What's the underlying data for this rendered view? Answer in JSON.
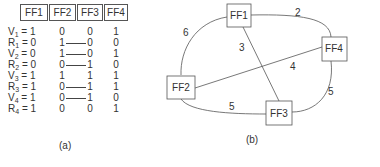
{
  "part_a": {
    "headers": [
      "FF1",
      "FF2",
      "FF3",
      "FF4"
    ],
    "rows": [
      {
        "var": "V",
        "sub": "1",
        "eq": "= 1",
        "vals": [
          "0",
          "0",
          "1"
        ],
        "link": false
      },
      {
        "var": "R",
        "sub": "1",
        "eq": "= 0",
        "vals": [
          "1",
          "0",
          "0"
        ],
        "link": true
      },
      {
        "var": "V",
        "sub": "2",
        "eq": "= 0",
        "vals": [
          "1",
          "0",
          "1"
        ],
        "link": true
      },
      {
        "var": "R",
        "sub": "2",
        "eq": "= 0",
        "vals": [
          "0",
          "1",
          "0"
        ],
        "link": true
      },
      {
        "var": "V",
        "sub": "3",
        "eq": "= 1",
        "vals": [
          "1",
          "1",
          "1"
        ],
        "link": false
      },
      {
        "var": "R",
        "sub": "3",
        "eq": "= 1",
        "vals": [
          "0",
          "1",
          "1"
        ],
        "link": true
      },
      {
        "var": "V",
        "sub": "4",
        "eq": "= 1",
        "vals": [
          "0",
          "1",
          "0"
        ],
        "link": true
      },
      {
        "var": "R",
        "sub": "4",
        "eq": "= 1",
        "vals": [
          "0",
          "0",
          "1"
        ],
        "link": false
      }
    ],
    "caption": "(a)"
  },
  "part_b": {
    "nodes": [
      {
        "id": "FF1",
        "label": "FF1"
      },
      {
        "id": "FF2",
        "label": "FF2"
      },
      {
        "id": "FF3",
        "label": "FF3"
      },
      {
        "id": "FF4",
        "label": "FF4"
      }
    ],
    "edges": [
      {
        "from": "FF1",
        "to": "FF4",
        "weight": "2"
      },
      {
        "from": "FF1",
        "to": "FF2",
        "weight": "6"
      },
      {
        "from": "FF1",
        "to": "FF3",
        "weight": "3"
      },
      {
        "from": "FF2",
        "to": "FF4",
        "weight": "4"
      },
      {
        "from": "FF2",
        "to": "FF3",
        "weight": "5"
      },
      {
        "from": "FF4",
        "to": "FF3",
        "weight": "5"
      }
    ],
    "caption": "(b)"
  }
}
